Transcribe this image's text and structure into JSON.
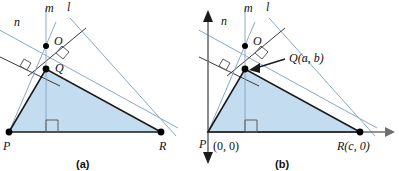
{
  "figure": {
    "colors": {
      "triangle_fill": "#c3dcef",
      "triangle_stroke": "#1a1a1a",
      "construction_line": "#8aa8c8",
      "axis": "#6f6f6f",
      "point": "#000000",
      "right_angle": "#5b5b5b"
    },
    "panels": [
      {
        "id": "a",
        "caption": "(a)",
        "line_labels": [
          {
            "name": "n",
            "text": "n",
            "x": 14,
            "y": 26
          },
          {
            "name": "m",
            "text": "m",
            "x": 45,
            "y": 12
          },
          {
            "name": "l",
            "text": "l",
            "x": 67,
            "y": 11
          }
        ],
        "points": [
          {
            "name": "O",
            "text": "O",
            "x": 46,
            "y": 46,
            "lx": 54,
            "ly": 45
          },
          {
            "name": "Q",
            "text": "Q",
            "x": 46,
            "y": 69,
            "lx": 55,
            "ly": 72
          },
          {
            "name": "P",
            "text": "P",
            "x": 9,
            "y": 132,
            "lx": 3,
            "ly": 150
          },
          {
            "name": "R",
            "text": "R",
            "x": 161,
            "y": 132,
            "lx": 159,
            "ly": 150
          }
        ]
      },
      {
        "id": "b",
        "caption": "(b)",
        "line_labels": [
          {
            "name": "n",
            "text": "n",
            "x": 22,
            "y": 25
          },
          {
            "name": "m",
            "text": "m",
            "x": 45,
            "y": 12
          },
          {
            "name": "l",
            "text": "l",
            "x": 67,
            "y": 11
          }
        ],
        "points": [
          {
            "name": "O",
            "text": "O",
            "x": 46,
            "y": 46,
            "lx": 54,
            "ly": 45
          },
          {
            "name": "Q",
            "text": "Q(a, b)",
            "x": 46,
            "y": 69,
            "lx": 90,
            "ly": 62
          },
          {
            "name": "P",
            "text": "P",
            "x": 9,
            "y": 132,
            "lx": 0,
            "ly": 148
          },
          {
            "name": "P-origin",
            "text": "(0, 0)",
            "x": 9,
            "y": 132,
            "lx": 14,
            "ly": 150
          },
          {
            "name": "R",
            "text": "R(c, 0)",
            "x": 161,
            "y": 132,
            "lx": 138,
            "ly": 150
          }
        ]
      }
    ]
  }
}
